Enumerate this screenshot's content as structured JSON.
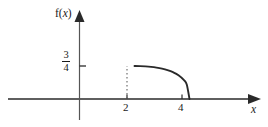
{
  "figure": {
    "background_color": "#ffffff",
    "ink_color": "#2a2a2a",
    "text_color": "#1a1a1a"
  },
  "labels": {
    "y_axis_label_prefix": "f(",
    "y_axis_label_variable": "x",
    "y_axis_label_suffix": ")",
    "x_axis_label": "x",
    "y_tick_numerator": "3",
    "y_tick_denominator": "4",
    "x_tick_left": "2",
    "x_tick_right": "4"
  },
  "chart_data": {
    "type": "line",
    "title": "",
    "subtitle": "",
    "xlabel": "x",
    "ylabel": "f(x)",
    "xlim": [
      -2.6,
      6.2
    ],
    "ylim": [
      -0.28,
      1.08
    ],
    "grid": false,
    "legend": null,
    "x_ticks": [
      2,
      4
    ],
    "x_tick_labels": [
      "2",
      "4"
    ],
    "y_ticks": [
      0.75
    ],
    "y_tick_labels": [
      "3/4"
    ],
    "axes_style": "arrows-on-positive-ends",
    "annotations": [
      {
        "kind": "dashed-vertical-segment",
        "x": 2,
        "y_from": 0,
        "y_to": 0.75,
        "note": "dotted drop line at x = 2 marking the jump to 3/4"
      },
      {
        "kind": "jump-discontinuity",
        "x": 2,
        "value_left": 0,
        "value_right": 0.75
      },
      {
        "kind": "endpoint-drop",
        "x": 4,
        "value_left": 0,
        "value_right": 0
      }
    ],
    "series": [
      {
        "name": "f(x) = 0 for x < 2",
        "x": [
          -2.6,
          2
        ],
        "values": [
          0,
          0
        ],
        "style": "solid"
      },
      {
        "name": "f(x) decreasing on 2 < x < 4",
        "x": [
          2.0,
          2.2,
          2.4,
          2.6,
          2.8,
          3.0,
          3.2,
          3.4,
          3.6,
          3.8,
          3.9,
          4.0
        ],
        "values": [
          0.75,
          0.748,
          0.742,
          0.731,
          0.714,
          0.69,
          0.656,
          0.609,
          0.541,
          0.43,
          0.33,
          0.0
        ],
        "style": "solid"
      },
      {
        "name": "f(x) = 0 for x > 4",
        "x": [
          4,
          6.2
        ],
        "values": [
          0,
          0
        ],
        "style": "solid"
      }
    ]
  }
}
